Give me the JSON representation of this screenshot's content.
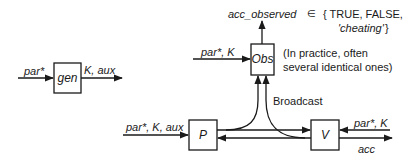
{
  "diagram": {
    "nodes": {
      "gen": {
        "label": "gen"
      },
      "obs": {
        "label": "Obs"
      },
      "p": {
        "label": "P"
      },
      "v": {
        "label": "V"
      }
    },
    "edges": {
      "gen_in": "par*",
      "gen_out": "K, aux",
      "obs_in": "par*, K",
      "obs_out": "acc_observed",
      "p_in": "par*, K, aux",
      "v_in": "par*, K",
      "v_out": "acc",
      "broadcast": "Broadcast"
    },
    "annotations": {
      "element_of": "∈",
      "set_line1": "{ TRUE, FALSE,",
      "set_line2": "'cheating'",
      "set_close": "}",
      "obs_note_line1": "(In practice, often",
      "obs_note_line2": "several identical ones)"
    },
    "colors": {
      "stroke": "#1a1a1a",
      "background": "#ffffff"
    }
  }
}
